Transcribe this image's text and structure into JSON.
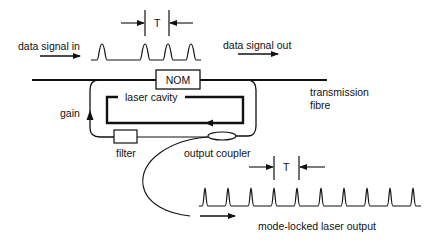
{
  "diagram": {
    "colors": {
      "ink": "#111111",
      "background": "#ffffff"
    },
    "labels": {
      "data_signal_in": "data signal in",
      "data_signal_out": "data signal out",
      "nom": "NOM",
      "laser_cavity": "laser cavity",
      "transmission_fibre_line1": "transmission",
      "transmission_fibre_line2": "fibre",
      "gain": "gain",
      "filter": "filter",
      "output_coupler": "output coupler",
      "period_top": "T",
      "period_bottom": "T",
      "mode_locked_output": "mode-locked laser output"
    },
    "components": [
      {
        "id": "nom",
        "label": "NOM",
        "type": "box"
      },
      {
        "id": "filter",
        "label": "filter",
        "type": "box"
      },
      {
        "id": "output-coupler",
        "label": "output coupler",
        "type": "ellipse"
      },
      {
        "id": "laser-cavity",
        "label": "laser cavity",
        "type": "loop"
      },
      {
        "id": "transmission-fibre",
        "label": "transmission fibre",
        "type": "line"
      }
    ],
    "signals": {
      "data_in_pulses": 4,
      "mode_locked_pulses": 10
    }
  }
}
